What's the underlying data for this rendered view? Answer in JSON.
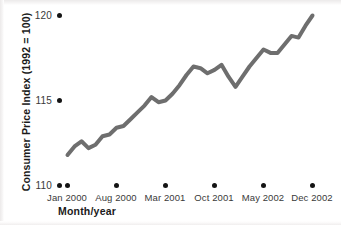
{
  "chart_data": {
    "type": "line",
    "title": "",
    "xlabel": "Month/year",
    "ylabel": "Consumer Price Index (1992 = 100)",
    "ylim": [
      110,
      120
    ],
    "ytick_labels": [
      "110",
      "115",
      "120"
    ],
    "ytick_values": [
      110,
      115,
      120
    ],
    "xtick_labels": [
      "Jan 2000",
      "Aug 2000",
      "Mar 2001",
      "Oct 2001",
      "May 2002",
      "Dec 2002"
    ],
    "xtick_values": [
      "2000-01",
      "2000-08",
      "2001-03",
      "2001-10",
      "2002-05",
      "2002-12"
    ],
    "grid": false,
    "legend": "none",
    "line_color": "#6e6e6e",
    "line_width_px": 4,
    "series": [
      {
        "name": "Consumer Price Index",
        "x": [
          "Jan 2000",
          "Feb 2000",
          "Mar 2000",
          "Apr 2000",
          "May 2000",
          "Jun 2000",
          "Jul 2000",
          "Aug 2000",
          "Sep 2000",
          "Oct 2000",
          "Nov 2000",
          "Dec 2000",
          "Jan 2001",
          "Feb 2001",
          "Mar 2001",
          "Apr 2001",
          "May 2001",
          "Jun 2001",
          "Jul 2001",
          "Aug 2001",
          "Sep 2001",
          "Oct 2001",
          "Nov 2001",
          "Dec 2001",
          "Jan 2002",
          "Feb 2002",
          "Mar 2002",
          "Apr 2002",
          "May 2002",
          "Jun 2002",
          "Jul 2002",
          "Aug 2002",
          "Sep 2002",
          "Oct 2002",
          "Nov 2002",
          "Dec 2002"
        ],
        "values": [
          111.8,
          112.3,
          112.6,
          112.2,
          112.4,
          112.9,
          113.0,
          113.4,
          113.5,
          113.9,
          114.3,
          114.7,
          115.2,
          114.9,
          115.0,
          115.4,
          115.9,
          116.5,
          117.0,
          116.9,
          116.6,
          116.8,
          117.1,
          116.4,
          115.8,
          116.4,
          117.0,
          117.5,
          118.0,
          117.8,
          117.8,
          118.3,
          118.8,
          118.7,
          119.4,
          120.0
        ]
      }
    ]
  },
  "axes": {
    "y_title": "Consumer Price Index (1992 = 100)",
    "x_title": "Month/year"
  }
}
